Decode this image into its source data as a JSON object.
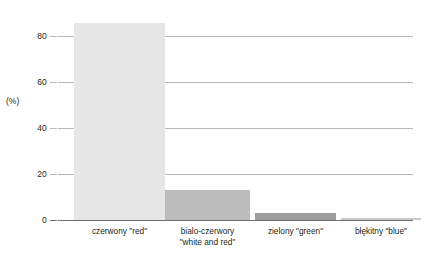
{
  "chart_data": {
    "type": "bar",
    "title": "",
    "xlabel": "",
    "ylabel": "(%)",
    "ylim": [
      0,
      88
    ],
    "grid": true,
    "legend": "none",
    "categories": [
      "czerwony \"red\"",
      "bialo-czerwory\n\"white and red\"",
      "zielony \"green\"",
      "błękitny \"blue\""
    ],
    "values": [
      85.5,
      13,
      3,
      0.7
    ],
    "yticks": [
      0,
      20,
      40,
      60,
      80
    ],
    "ytick_labels": [
      "0",
      "20",
      "40",
      "60",
      "80"
    ],
    "bar_colors": [
      "#e6e6e6",
      "#bcbcbc",
      "#9e9e9e",
      "#c9c9c9"
    ]
  },
  "axis": {
    "y_title": "(%)"
  },
  "bars": [
    {
      "label": "czerwony \"red\"",
      "value": 85.5,
      "color": "#e6e6e6",
      "left_px": 16,
      "width_px": 91
    },
    {
      "label": "bialo-czerwory\n\"white and red\"",
      "value": 13,
      "color": "#bcbcbc",
      "left_px": 107,
      "width_px": 85
    },
    {
      "label": "zielony \"green\"",
      "value": 3,
      "color": "#9e9e9e",
      "left_px": 197,
      "width_px": 81
    },
    {
      "label": "błękitny \"blue\"",
      "value": 0.7,
      "color": "#c9c9c9",
      "left_px": 283,
      "width_px": 80
    }
  ],
  "ticks": [
    {
      "label": "80",
      "value": 80
    },
    {
      "label": "60",
      "value": 60
    },
    {
      "label": "40",
      "value": 40
    },
    {
      "label": "20",
      "value": 20
    },
    {
      "label": "0",
      "value": 0
    }
  ]
}
